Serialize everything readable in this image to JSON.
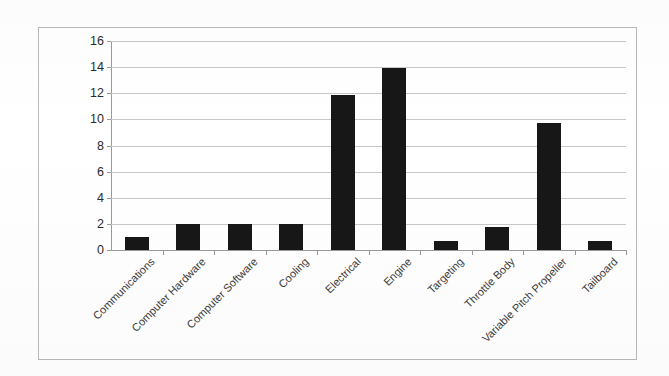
{
  "chart_data": {
    "type": "bar",
    "title": "",
    "subtitle": "",
    "xlabel": "",
    "ylabel": "",
    "ylim": [
      0,
      16
    ],
    "ytick_step": 2,
    "yticks": [
      0,
      2,
      4,
      6,
      8,
      10,
      12,
      14,
      16
    ],
    "ytick_labels": [
      "0",
      "2",
      "4",
      "6",
      "8",
      "10",
      "12",
      "14",
      "16"
    ],
    "grid": true,
    "legend": false,
    "legend_position": "none",
    "bar_color": "#171717",
    "categories": [
      "Communications",
      "Computer Hardware",
      "Computer Software",
      "Cooling",
      "Electrical",
      "Engine",
      "Targeting",
      "Throttle Body",
      "Variable Pitch Propeller",
      "Tailboard"
    ],
    "values": [
      1,
      2,
      2,
      2,
      11.9,
      13.9,
      0.7,
      1.8,
      9.7,
      0.7
    ],
    "series": [
      {
        "name": "Count",
        "values": [
          1,
          2,
          2,
          2,
          11.9,
          13.9,
          0.7,
          1.8,
          9.7,
          0.7
        ]
      }
    ]
  },
  "style": {
    "gridline_color": "#c8c8c8",
    "axis_color": "#9a9a9a",
    "frame_color": "#b9b9b9",
    "background": "#ffffff",
    "label_color": "#3a3a3a"
  }
}
